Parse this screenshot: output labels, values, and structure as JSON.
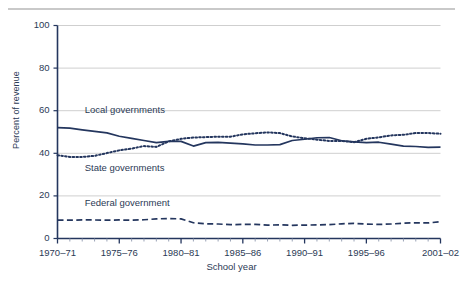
{
  "figure": {
    "top_rule": true,
    "accent_color": "#24365e",
    "grid_color": "#cfcfcf",
    "text_color": "#2b3a55"
  },
  "chart_data": {
    "type": "line",
    "title": "",
    "xlabel": "School year",
    "ylabel": "Percent of revenue",
    "ylim": [
      0,
      100
    ],
    "yticks": [
      0,
      20,
      40,
      60,
      80,
      100
    ],
    "ytick_labels": [
      "0",
      "20",
      "40",
      "60",
      "80",
      "100"
    ],
    "grid": "horizontal",
    "legend_position": "inline-annotations",
    "xtick_labels": [
      "1970–71",
      "1975–76",
      "1980–81",
      "1985–86",
      "1990–91",
      "1995–96",
      "2001–02"
    ],
    "xtick_years": [
      1970,
      1975,
      1980,
      1985,
      1990,
      1995,
      2001
    ],
    "x_start": 1970,
    "x_end": 2001,
    "x": [
      1970,
      1971,
      1972,
      1973,
      1974,
      1975,
      1976,
      1977,
      1978,
      1979,
      1980,
      1981,
      1982,
      1983,
      1984,
      1985,
      1986,
      1987,
      1988,
      1989,
      1990,
      1991,
      1992,
      1993,
      1994,
      1995,
      1996,
      1997,
      1998,
      1999,
      2000,
      2001
    ],
    "series": [
      {
        "name": "Local governments",
        "style": "solid",
        "color": "#24365e",
        "label_x": 1972.2,
        "label_y": 60.0,
        "values": [
          52.1,
          51.8,
          51.0,
          50.3,
          49.6,
          48.0,
          47.0,
          46.0,
          45.0,
          45.6,
          45.6,
          43.4,
          45.0,
          45.1,
          44.8,
          44.4,
          43.9,
          43.9,
          44.1,
          46.0,
          46.6,
          47.3,
          47.4,
          45.9,
          45.4,
          45.0,
          45.2,
          44.3,
          43.4,
          43.2,
          42.8,
          42.9
        ]
      },
      {
        "name": "State governments",
        "style": "dotted",
        "color": "#24365e",
        "label_x": 1972.2,
        "label_y": 32.5,
        "values": [
          39.1,
          38.3,
          38.3,
          38.8,
          40.1,
          41.4,
          42.2,
          43.4,
          43.0,
          45.6,
          46.8,
          47.4,
          47.6,
          47.8,
          47.8,
          48.9,
          49.4,
          49.8,
          49.5,
          47.9,
          47.1,
          46.4,
          45.8,
          45.8,
          45.2,
          46.8,
          47.5,
          48.4,
          48.7,
          49.5,
          49.5,
          49.2
        ]
      },
      {
        "name": "Federal government",
        "style": "dashed",
        "color": "#24365e",
        "label_x": 1972.2,
        "label_y": 16.0,
        "values": [
          8.6,
          8.6,
          8.7,
          8.7,
          8.6,
          8.7,
          8.6,
          8.8,
          9.2,
          9.4,
          9.2,
          7.4,
          6.9,
          6.8,
          6.5,
          6.6,
          6.6,
          6.3,
          6.4,
          6.2,
          6.3,
          6.4,
          6.5,
          6.9,
          7.1,
          6.8,
          6.6,
          6.8,
          7.2,
          7.4,
          7.3,
          7.9
        ]
      }
    ]
  }
}
